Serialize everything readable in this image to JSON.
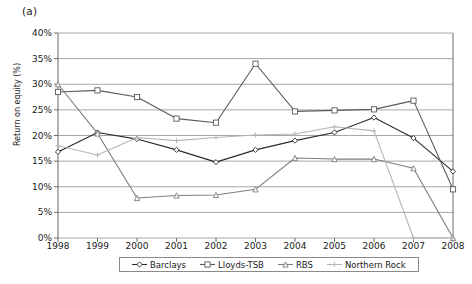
{
  "panel": {
    "label": "(a)"
  },
  "axes": {
    "y_title": "Return on equity (%)",
    "y_ticks": [
      "0%",
      "5%",
      "10%",
      "15%",
      "20%",
      "25%",
      "30%",
      "35%",
      "40%"
    ],
    "x_ticks": [
      "1998",
      "1999",
      "2000",
      "2001",
      "2002",
      "2003",
      "2004",
      "2005",
      "2006",
      "2007",
      "2008"
    ]
  },
  "legend": {
    "items": [
      {
        "label": "Barclays",
        "color": "#2b2b2b",
        "marker": "diamond"
      },
      {
        "label": "Lloyds-TSB",
        "color": "#5a5a5a",
        "marker": "square"
      },
      {
        "label": "RBS",
        "color": "#7d7d7d",
        "marker": "triangle"
      },
      {
        "label": "Northern Rock",
        "color": "#b5b5b5",
        "marker": "plus"
      }
    ]
  },
  "chart_data": {
    "type": "line",
    "title": "",
    "xlabel": "",
    "ylabel": "Return on equity (%)",
    "x": [
      1998,
      1999,
      2000,
      2001,
      2002,
      2003,
      2004,
      2005,
      2006,
      2007,
      2008
    ],
    "categories": [
      "1998",
      "1999",
      "2000",
      "2001",
      "2002",
      "2003",
      "2004",
      "2005",
      "2006",
      "2007",
      "2008"
    ],
    "ylim": [
      0,
      40
    ],
    "ytick_values": [
      0,
      5,
      10,
      15,
      20,
      25,
      30,
      35,
      40
    ],
    "grid": "horizontal",
    "legend_position": "bottom",
    "series": [
      {
        "name": "Barclays",
        "color": "#2b2b2b",
        "marker": "diamond",
        "values": [
          16.8,
          20.6,
          19.3,
          17.2,
          14.8,
          17.2,
          19.0,
          20.6,
          23.5,
          19.5,
          13.0
        ]
      },
      {
        "name": "Lloyds-TSB",
        "color": "#5a5a5a",
        "marker": "square",
        "values": [
          28.5,
          28.8,
          27.5,
          23.3,
          22.5,
          34.0,
          24.7,
          24.9,
          25.1,
          26.8,
          9.5
        ]
      },
      {
        "name": "RBS",
        "color": "#7d7d7d",
        "marker": "triangle",
        "values": [
          30.0,
          20.4,
          7.8,
          8.3,
          8.4,
          9.5,
          15.6,
          15.4,
          15.4,
          13.6,
          0.0
        ]
      },
      {
        "name": "Northern Rock",
        "color": "#b5b5b5",
        "marker": "plus",
        "values": [
          18.0,
          16.2,
          19.6,
          19.0,
          19.6,
          20.1,
          20.3,
          21.7,
          20.9,
          0.0,
          0.0
        ]
      }
    ]
  }
}
